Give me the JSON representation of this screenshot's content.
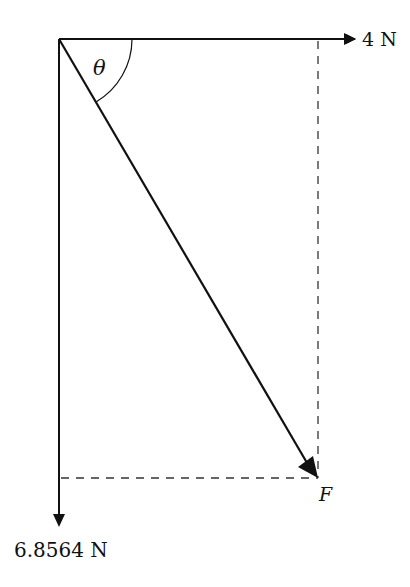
{
  "diagram": {
    "type": "force-vector-resolution",
    "labels": {
      "horizontal_force": "4 N",
      "vertical_force": "6.8564 N",
      "resultant": "F",
      "angle": "θ"
    },
    "colors": {
      "line": "#111111",
      "dashed": "#333333",
      "background": "#ffffff"
    }
  }
}
